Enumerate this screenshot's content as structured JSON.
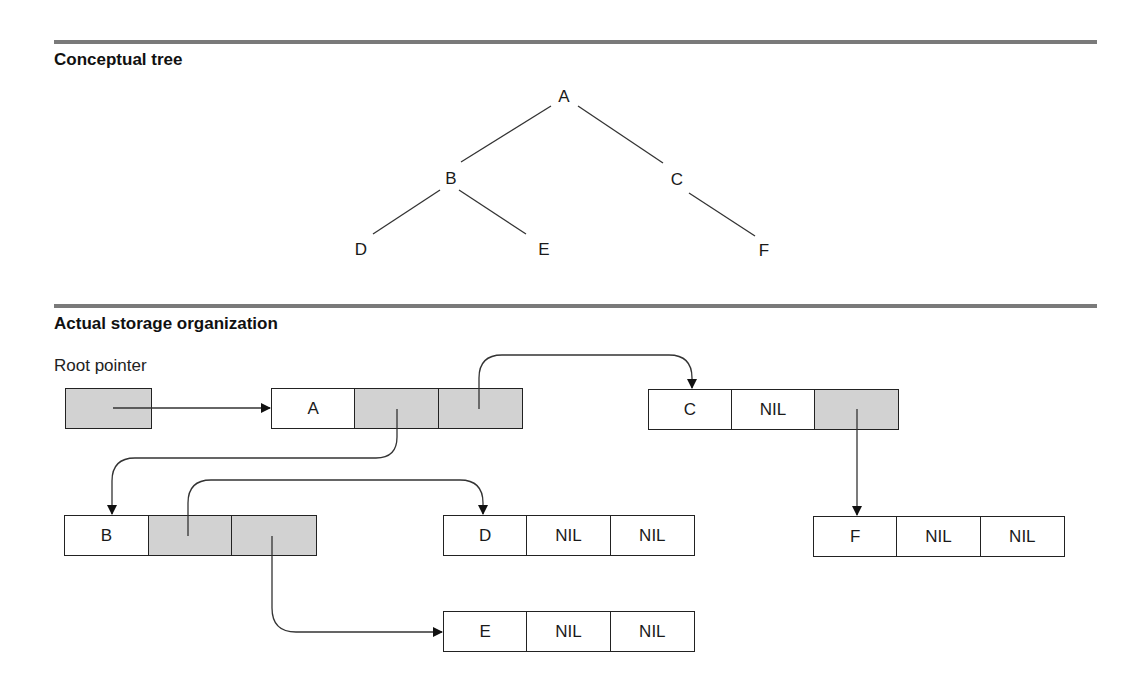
{
  "sections": {
    "conceptual": {
      "title": "Conceptual tree"
    },
    "storage": {
      "title": "Actual storage organization",
      "root_label": "Root pointer"
    }
  },
  "tree": {
    "nodes": {
      "A": "A",
      "B": "B",
      "C": "C",
      "D": "D",
      "E": "E",
      "F": "F"
    },
    "edges": [
      [
        "A",
        "B"
      ],
      [
        "A",
        "C"
      ],
      [
        "B",
        "D"
      ],
      [
        "B",
        "E"
      ],
      [
        "C",
        "F"
      ]
    ]
  },
  "storage_nodes": {
    "A": {
      "value": "A",
      "left": "",
      "right": ""
    },
    "B": {
      "value": "B",
      "left": "",
      "right": ""
    },
    "C": {
      "value": "C",
      "left": "NIL",
      "right": ""
    },
    "D": {
      "value": "D",
      "left": "NIL",
      "right": "NIL"
    },
    "E": {
      "value": "E",
      "left": "NIL",
      "right": "NIL"
    },
    "F": {
      "value": "F",
      "left": "NIL",
      "right": "NIL"
    }
  },
  "pointers": [
    {
      "from": "root",
      "to": "A"
    },
    {
      "from": "A.left",
      "to": "B"
    },
    {
      "from": "A.right",
      "to": "C"
    },
    {
      "from": "B.left",
      "to": "D"
    },
    {
      "from": "B.right",
      "to": "E"
    },
    {
      "from": "C.right",
      "to": "F"
    }
  ],
  "colors": {
    "pointer_fill": "#d2d2d2",
    "rule": "#7a7a7a",
    "line": "#222222"
  }
}
